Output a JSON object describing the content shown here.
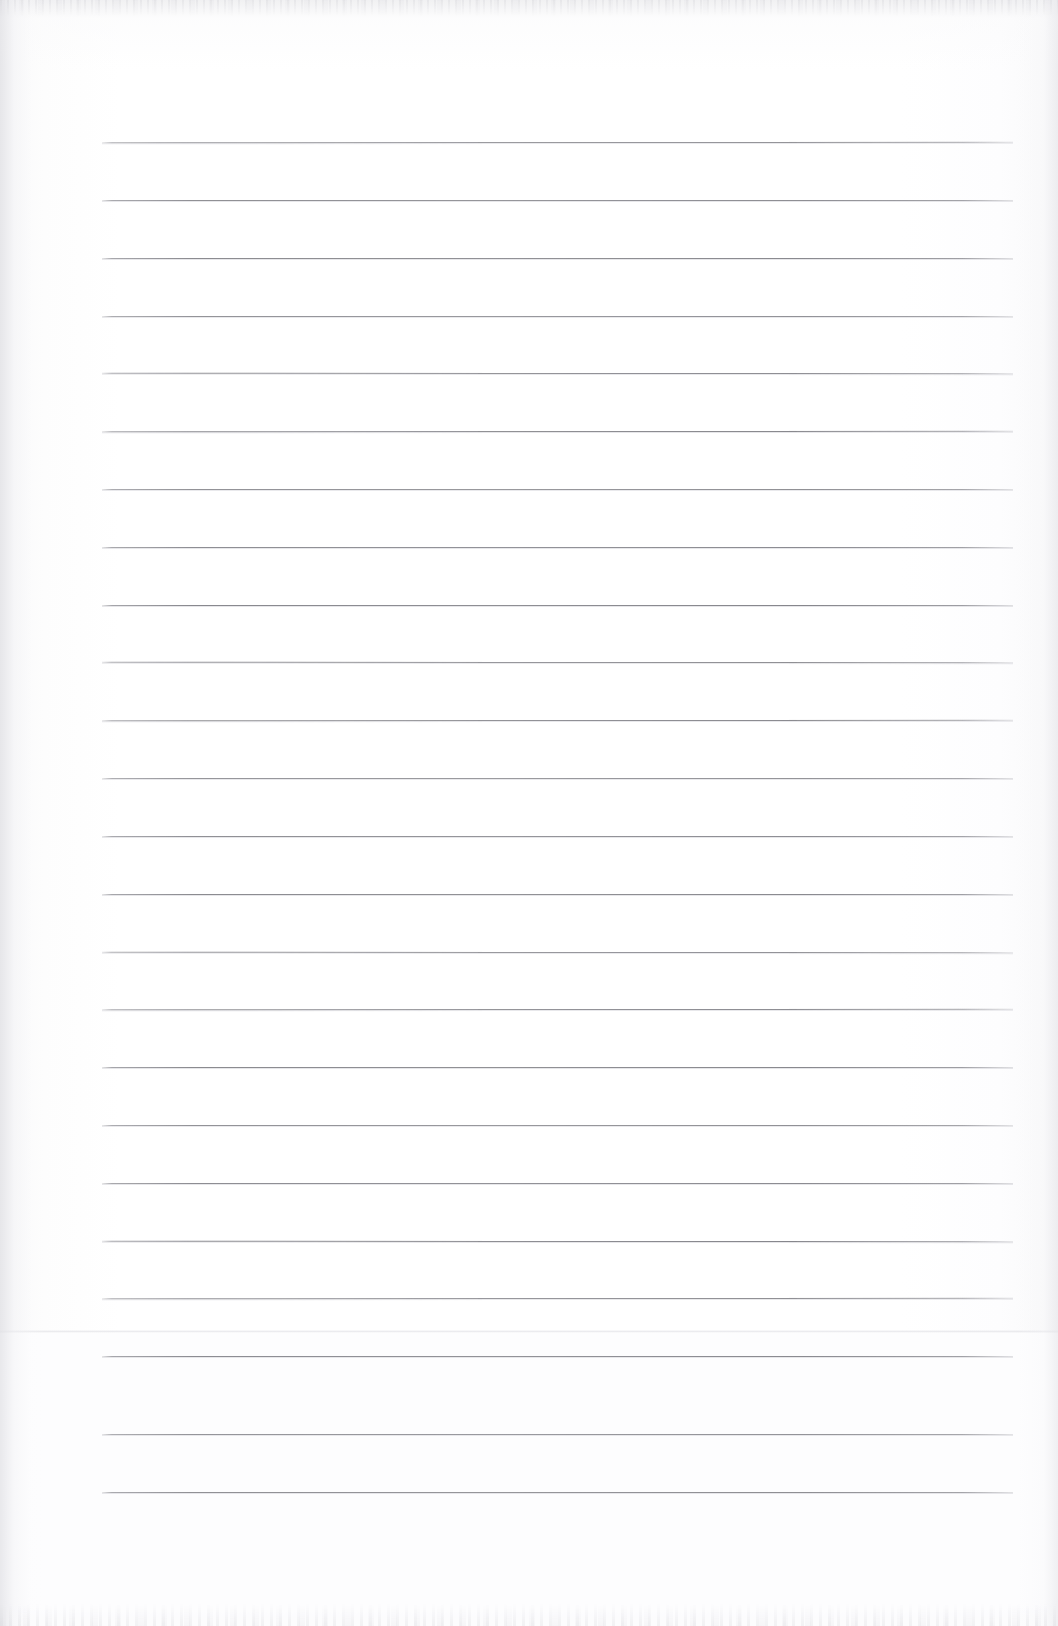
{
  "document": {
    "kind": "scanned-lined-notebook-page",
    "title": "Blank Ruled Notebook Page",
    "body_text": "",
    "page_width_px": 1058,
    "page_height_px": 1626,
    "background_color": "#ffffff",
    "rule_color": "#828288",
    "edge_shadow_color": "#e2e2e6"
  },
  "ruling": {
    "line_count": 24,
    "first_line_y": 142,
    "line_spacing_px": 58.7,
    "line_left_x": 102,
    "line_right_x": 1013,
    "line_thickness_px": 1,
    "lines_y": [
      142,
      200,
      258,
      316,
      373,
      431,
      489,
      547,
      605,
      662,
      720,
      778,
      836,
      894,
      952,
      1009,
      1067,
      1125,
      1183,
      1241,
      1298,
      1356,
      1434,
      1492
    ]
  },
  "artifacts": {
    "top_noise_band": {
      "y": 0,
      "height": 16
    },
    "bottom_noise_band": {
      "y": 1604,
      "height": 22
    },
    "scan_seam": {
      "y": 1330,
      "height": 3
    },
    "scan_band": {
      "y": 1333,
      "height": 293
    },
    "left_gutter_shadow_width": 46,
    "right_edge_shadow_width": 40
  },
  "content": {
    "handwriting": [],
    "margin_rule": null,
    "header_text": "",
    "footer_text": "",
    "page_number": ""
  }
}
